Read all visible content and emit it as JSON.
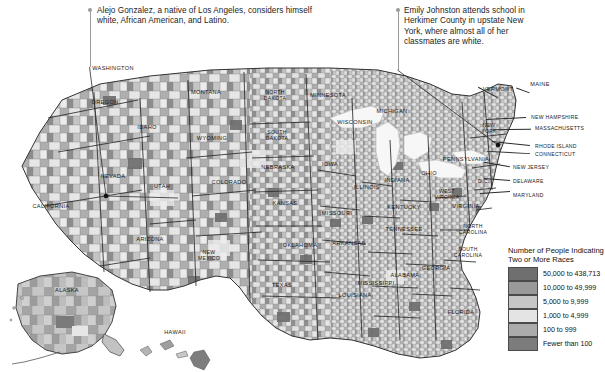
{
  "figure": {
    "type": "choropleth-map"
  },
  "annotations": [
    {
      "name": "annotation-alejo-gonzalez",
      "text": "Alejo Gonzalez, a native of Los Angeles, considers himself white, African American, and Latino.",
      "target": "Los Angeles County, California"
    },
    {
      "name": "annotation-emily-johnston",
      "text": "Emily Johnston attends school in Herkimer County in upstate New York, where almost all of her classmates are white.",
      "target": "Herkimer County, New York"
    }
  ],
  "legend": {
    "title": "Number of People Indicating Two or More Races",
    "entries": [
      {
        "label": "50,000 to 438,713",
        "color": "#6f6f6f"
      },
      {
        "label": "10,000 to 49,999",
        "color": "#9a9a9a"
      },
      {
        "label": "5,000 to 9,999",
        "color": "#c6c6c6"
      },
      {
        "label": "1,000 to 4,999",
        "color": "#e4e4e4"
      },
      {
        "label": "100 to 999",
        "color": "#ababab"
      },
      {
        "label": "Fewer than 100",
        "color": "#7c7c7c"
      }
    ]
  },
  "state_labels": [
    {
      "name": "washington",
      "text": "WASHINGTON",
      "x": 113,
      "y": 68
    },
    {
      "name": "oregon",
      "text": "OREGON",
      "x": 105,
      "y": 102
    },
    {
      "name": "idaho",
      "text": "IDAHO",
      "x": 147,
      "y": 127
    },
    {
      "name": "montana",
      "text": "MONTANA",
      "x": 206,
      "y": 92
    },
    {
      "name": "wyoming",
      "text": "WYOMING",
      "x": 212,
      "y": 138
    },
    {
      "name": "nevada",
      "text": "NEVADA",
      "x": 113,
      "y": 176
    },
    {
      "name": "utah",
      "text": "UTAH",
      "x": 162,
      "y": 186
    },
    {
      "name": "california",
      "text": "CALIFORNIA",
      "x": 51,
      "y": 206
    },
    {
      "name": "arizona",
      "text": "ARIZONA",
      "x": 150,
      "y": 239
    },
    {
      "name": "new-mexico",
      "text": "NEW\nMEXICO",
      "x": 209,
      "y": 255
    },
    {
      "name": "colorado",
      "text": "COLORADO",
      "x": 229,
      "y": 182
    },
    {
      "name": "north-dakota",
      "text": "NORTH\nDAKOTA",
      "x": 275,
      "y": 95
    },
    {
      "name": "south-dakota",
      "text": "SOUTH\nDAKOTA",
      "x": 277,
      "y": 135
    },
    {
      "name": "nebraska",
      "text": "NEBRASKA",
      "x": 278,
      "y": 167
    },
    {
      "name": "kansas",
      "text": "KANSAS",
      "x": 285,
      "y": 203
    },
    {
      "name": "oklahoma",
      "text": "OKLAHOMA",
      "x": 300,
      "y": 245
    },
    {
      "name": "texas",
      "text": "TEXAS",
      "x": 282,
      "y": 285
    },
    {
      "name": "minnesota",
      "text": "MINNESOTA",
      "x": 328,
      "y": 95
    },
    {
      "name": "iowa",
      "text": "IOWA",
      "x": 330,
      "y": 164
    },
    {
      "name": "missouri",
      "text": "MISSOURI",
      "x": 337,
      "y": 213
    },
    {
      "name": "arkansas",
      "text": "ARKANSAS",
      "x": 349,
      "y": 243
    },
    {
      "name": "louisiana",
      "text": "LOUISIANA",
      "x": 355,
      "y": 295
    },
    {
      "name": "wisconsin",
      "text": "WISCONSIN",
      "x": 355,
      "y": 122
    },
    {
      "name": "michigan",
      "text": "MICHIGAN",
      "x": 392,
      "y": 111
    },
    {
      "name": "illinois",
      "text": "ILLINOIS",
      "x": 367,
      "y": 187
    },
    {
      "name": "indiana",
      "text": "INDIANA",
      "x": 397,
      "y": 180
    },
    {
      "name": "ohio",
      "text": "OHIO",
      "x": 429,
      "y": 173
    },
    {
      "name": "kentucky",
      "text": "KENTUCKY",
      "x": 404,
      "y": 207
    },
    {
      "name": "tennessee",
      "text": "TENNESSEE",
      "x": 404,
      "y": 229
    },
    {
      "name": "mississippi",
      "text": "MISSISSIPPI",
      "x": 376,
      "y": 283
    },
    {
      "name": "alabama",
      "text": "ALABAMA",
      "x": 405,
      "y": 275
    },
    {
      "name": "georgia",
      "text": "GEORGIA",
      "x": 436,
      "y": 268
    },
    {
      "name": "florida",
      "text": "FLORIDA",
      "x": 461,
      "y": 312
    },
    {
      "name": "south-carolina",
      "text": "SOUTH\nCAROLINA",
      "x": 468,
      "y": 252
    },
    {
      "name": "north-carolina",
      "text": "NORTH\nCAROLINA",
      "x": 473,
      "y": 229
    },
    {
      "name": "virginia",
      "text": "VIRGINIA",
      "x": 466,
      "y": 206
    },
    {
      "name": "west-virginia",
      "text": "WEST\nVIRGINIA",
      "x": 447,
      "y": 194
    },
    {
      "name": "pennsylvania",
      "text": "PENNSYLVANIA",
      "x": 466,
      "y": 159
    },
    {
      "name": "new-york",
      "text": "NEW\nYORK",
      "x": 489,
      "y": 128
    },
    {
      "name": "vermont",
      "text": "VERMONT",
      "x": 498,
      "y": 89
    },
    {
      "name": "maine",
      "text": "MAINE",
      "x": 540,
      "y": 84
    },
    {
      "name": "alaska",
      "text": "ALASKA",
      "x": 67,
      "y": 290
    },
    {
      "name": "hawaii",
      "text": "HAWAII",
      "x": 175,
      "y": 332
    }
  ],
  "callout_state_labels": [
    {
      "name": "new-hampshire",
      "text": "NEW HAMPSHIRE",
      "x": 531,
      "y": 117
    },
    {
      "name": "massachusetts",
      "text": "MASSACHUSETTS",
      "x": 535,
      "y": 128
    },
    {
      "name": "rhode-island",
      "text": "RHODE ISLAND",
      "x": 535,
      "y": 146
    },
    {
      "name": "connecticut",
      "text": "CONNECTICUT",
      "x": 535,
      "y": 154
    },
    {
      "name": "new-jersey",
      "text": "NEW JERSEY",
      "x": 513,
      "y": 167
    },
    {
      "name": "delaware",
      "text": "DELAWARE",
      "x": 513,
      "y": 181
    },
    {
      "name": "maryland",
      "text": "MARYLAND",
      "x": 513,
      "y": 195
    },
    {
      "name": "district-of-columbia",
      "text": "D.C.",
      "x": 478,
      "y": 181
    }
  ]
}
